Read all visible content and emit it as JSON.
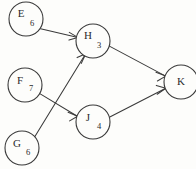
{
  "diagram": {
    "type": "directed-graph",
    "background_color": "#fdfdfb",
    "stroke_color": "#3a3a3a",
    "text_color": "#2b2b2b",
    "node_radius": 17,
    "nodes": [
      {
        "id": "E",
        "label": "E",
        "subscript": "6",
        "cx": 26,
        "cy": 19
      },
      {
        "id": "H",
        "label": "H",
        "subscript": "3",
        "cx": 93,
        "cy": 41
      },
      {
        "id": "F",
        "label": "F",
        "subscript": "7",
        "cx": 25,
        "cy": 85
      },
      {
        "id": "J",
        "label": "J",
        "subscript": "4",
        "cx": 93,
        "cy": 122
      },
      {
        "id": "G",
        "label": "G",
        "subscript": "6",
        "cx": 22,
        "cy": 148
      },
      {
        "id": "K",
        "label": "K",
        "subscript": "",
        "cx": 181,
        "cy": 82
      }
    ],
    "edges": [
      {
        "id": "E-H",
        "from": "E",
        "to": "H",
        "directed": true
      },
      {
        "id": "G-H",
        "from": "G",
        "to": "H",
        "directed": true
      },
      {
        "id": "F-J",
        "from": "F",
        "to": "J",
        "directed": true
      },
      {
        "id": "H-K",
        "from": "H",
        "to": "K",
        "directed": true
      },
      {
        "id": "J-K",
        "from": "J",
        "to": "K",
        "directed": true
      }
    ]
  }
}
